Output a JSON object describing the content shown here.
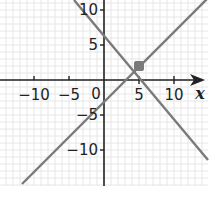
{
  "chart_data": {
    "type": "line",
    "title": "",
    "xlabel": "x",
    "ylabel": "",
    "xlim": [
      -15,
      14
    ],
    "ylim": [
      -15,
      11.5
    ],
    "grid": true,
    "grid_step": 1,
    "legend": null,
    "x_ticks": [
      -10,
      -5,
      5,
      10
    ],
    "x_tick_labels": [
      "−10",
      "−5",
      "5",
      "10"
    ],
    "y_ticks": [
      10,
      5,
      -5,
      -10
    ],
    "y_tick_labels": [
      "10",
      "5",
      "−5",
      "−10"
    ],
    "origin_label": "0",
    "series": [
      {
        "name": "y = −x + 7",
        "slope": -1,
        "intercept": 7,
        "x": [
          -4.3,
          14.9
        ],
        "y": [
          11.3,
          -7.9
        ],
        "color": "#7a7a7a"
      },
      {
        "name": "y = x − 3",
        "slope": 1,
        "intercept": -3,
        "x": [
          -11.6,
          14.9
        ],
        "y": [
          -14.6,
          11.9
        ],
        "color": "#7a7a7a"
      }
    ],
    "annotations": [
      {
        "type": "point",
        "label": "intersection",
        "x": 5,
        "y": 2,
        "marker": "square",
        "color": "#7a7a7a"
      }
    ]
  },
  "labels": {
    "x_axis_var": "x",
    "origin": "0",
    "xt_m10": "−10",
    "xt_m5": "−5",
    "xt_5": "5",
    "xt_10": "10",
    "yt_10": "10",
    "yt_5": "5",
    "yt_m5": "−5",
    "yt_m10": "−10"
  },
  "colors": {
    "grid": "#e6e6e6",
    "axis": "#222222",
    "line": "#7a7a7a",
    "point": "#7a7a7a"
  }
}
